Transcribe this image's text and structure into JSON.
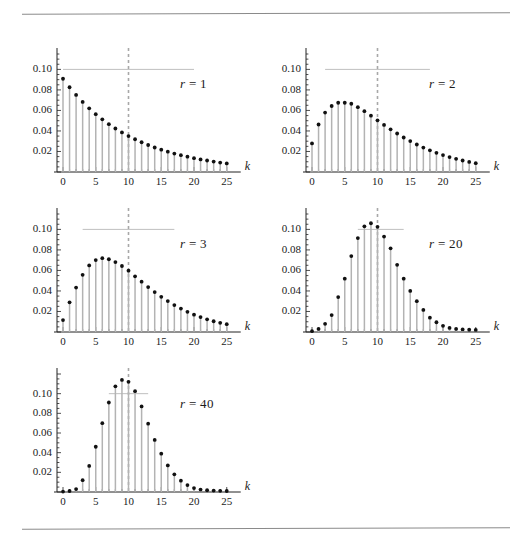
{
  "figure": {
    "title": "",
    "background_color": "#ffffff",
    "rule_color": "#8a8a8a",
    "stem_color": "#b3b3b3",
    "dot_color": "#111111",
    "guide_color": "#b8b8b8",
    "dash_color": "#a8a8a8",
    "axis_color": "#222222",
    "x_axis_label": "k",
    "y_tick_labels": [
      "0.02",
      "0.04",
      "0.06",
      "0.08",
      "0.10"
    ],
    "x_tick_labels": [
      "0",
      "5",
      "10",
      "15",
      "20",
      "25"
    ],
    "panel_labels": [
      "r = 1",
      "r = 2",
      "r = 3",
      "r = 20",
      "r = 40"
    ]
  },
  "chart_data": [
    {
      "type": "bar",
      "title": "r = 1",
      "label_r_symbol": "r",
      "label_equals": "=",
      "label_r_value": "1",
      "xlabel": "k",
      "ylabel": "",
      "xlim": [
        -1,
        26
      ],
      "ylim": [
        0,
        0.115
      ],
      "xticks": [
        0,
        5,
        10,
        15,
        20,
        25
      ],
      "yticks": [
        0.02,
        0.04,
        0.06,
        0.08,
        0.1
      ],
      "grid": false,
      "legend": "none",
      "reference_line_y": 0.1,
      "reference_line_x_span": [
        0,
        20
      ],
      "vertical_dashed_line_x": 10,
      "categories": [
        0,
        1,
        2,
        3,
        4,
        5,
        6,
        7,
        8,
        9,
        10,
        11,
        12,
        13,
        14,
        15,
        16,
        17,
        18,
        19,
        20,
        21,
        22,
        23,
        24,
        25
      ],
      "values": [
        0.0909,
        0.0826,
        0.0751,
        0.0683,
        0.0621,
        0.0564,
        0.0513,
        0.0466,
        0.0424,
        0.0386,
        0.035,
        0.0319,
        0.029,
        0.0263,
        0.0239,
        0.0218,
        0.0198,
        0.018,
        0.0164,
        0.0149,
        0.0135,
        0.0123,
        0.0112,
        0.0102,
        0.0092,
        0.0084
      ]
    },
    {
      "type": "bar",
      "title": "r = 2",
      "label_r_symbol": "r",
      "label_equals": "=",
      "label_r_value": "2",
      "xlabel": "k",
      "ylabel": "",
      "xlim": [
        -1,
        26
      ],
      "ylim": [
        0,
        0.115
      ],
      "xticks": [
        0,
        5,
        10,
        15,
        20,
        25
      ],
      "yticks": [
        0.02,
        0.04,
        0.06,
        0.08,
        0.1
      ],
      "grid": false,
      "legend": "none",
      "reference_line_y": 0.1,
      "reference_line_x_span": [
        2,
        18
      ],
      "vertical_dashed_line_x": 10,
      "categories": [
        0,
        1,
        2,
        3,
        4,
        5,
        6,
        7,
        8,
        9,
        10,
        11,
        12,
        13,
        14,
        15,
        16,
        17,
        18,
        19,
        20,
        21,
        22,
        23,
        24,
        25
      ],
      "values": [
        0.0278,
        0.0463,
        0.0579,
        0.0643,
        0.0675,
        0.0675,
        0.0665,
        0.0632,
        0.0593,
        0.0549,
        0.0504,
        0.0459,
        0.0416,
        0.0375,
        0.0336,
        0.0301,
        0.0268,
        0.0238,
        0.0211,
        0.0187,
        0.0165,
        0.0145,
        0.0128,
        0.0112,
        0.0098,
        0.0086
      ]
    },
    {
      "type": "bar",
      "title": "r = 3",
      "label_r_symbol": "r",
      "label_equals": "=",
      "label_r_value": "3",
      "xlabel": "k",
      "ylabel": "",
      "xlim": [
        -1,
        26
      ],
      "ylim": [
        0,
        0.115
      ],
      "xticks": [
        0,
        5,
        10,
        15,
        20,
        25
      ],
      "yticks": [
        0.02,
        0.04,
        0.06,
        0.08,
        0.1
      ],
      "grid": false,
      "legend": "none",
      "reference_line_y": 0.1,
      "reference_line_x_span": [
        3,
        17
      ],
      "vertical_dashed_line_x": 10,
      "categories": [
        0,
        1,
        2,
        3,
        4,
        5,
        6,
        7,
        8,
        9,
        10,
        11,
        12,
        13,
        14,
        15,
        16,
        17,
        18,
        19,
        20,
        21,
        22,
        23,
        24,
        25
      ],
      "values": [
        0.0116,
        0.0289,
        0.0433,
        0.0557,
        0.0649,
        0.0701,
        0.0719,
        0.0709,
        0.0681,
        0.0643,
        0.0598,
        0.0543,
        0.049,
        0.0438,
        0.0389,
        0.0343,
        0.0301,
        0.0262,
        0.0228,
        0.0197,
        0.0169,
        0.0145,
        0.0124,
        0.0105,
        0.0089,
        0.0076
      ]
    },
    {
      "type": "bar",
      "title": "r = 20",
      "label_r_symbol": "r",
      "label_equals": "=",
      "label_r_value": "20",
      "xlabel": "k",
      "ylabel": "",
      "xlim": [
        -1,
        26
      ],
      "ylim": [
        0,
        0.115
      ],
      "xticks": [
        0,
        5,
        10,
        15,
        20,
        25
      ],
      "yticks": [
        0.02,
        0.04,
        0.06,
        0.08,
        0.1
      ],
      "grid": false,
      "legend": "none",
      "reference_line_y": 0.1,
      "reference_line_x_span": [
        7,
        14
      ],
      "vertical_dashed_line_x": 10,
      "categories": [
        0,
        1,
        2,
        3,
        4,
        5,
        6,
        7,
        8,
        9,
        10,
        11,
        12,
        13,
        14,
        15,
        16,
        17,
        18,
        19,
        20,
        21,
        22,
        23,
        24,
        25
      ],
      "values": [
        0.0008,
        0.003,
        0.008,
        0.0165,
        0.034,
        0.052,
        0.074,
        0.0915,
        0.103,
        0.106,
        0.1025,
        0.093,
        0.0815,
        0.0655,
        0.052,
        0.04,
        0.03,
        0.0215,
        0.014,
        0.0095,
        0.006,
        0.004,
        0.003,
        0.0025,
        0.0022,
        0.002
      ]
    },
    {
      "type": "bar",
      "title": "r = 40",
      "label_r_symbol": "r",
      "label_equals": "=",
      "label_r_value": "40",
      "xlabel": "k",
      "ylabel": "",
      "xlim": [
        -1,
        26
      ],
      "ylim": [
        0,
        0.12
      ],
      "xticks": [
        0,
        5,
        10,
        15,
        20,
        25
      ],
      "yticks": [
        0.02,
        0.04,
        0.06,
        0.08,
        0.1
      ],
      "grid": false,
      "legend": "none",
      "reference_line_y": 0.1,
      "reference_line_x_span": [
        7,
        13
      ],
      "vertical_dashed_line_x": 10,
      "categories": [
        0,
        1,
        2,
        3,
        4,
        5,
        6,
        7,
        8,
        9,
        10,
        11,
        12,
        13,
        14,
        15,
        16,
        17,
        18,
        19,
        20,
        21,
        22,
        23,
        24,
        25
      ],
      "values": [
        0.0004,
        0.001,
        0.003,
        0.012,
        0.0265,
        0.046,
        0.07,
        0.091,
        0.1075,
        0.114,
        0.112,
        0.1025,
        0.087,
        0.0695,
        0.053,
        0.039,
        0.027,
        0.018,
        0.0115,
        0.007,
        0.004,
        0.0025,
        0.0018,
        0.0015,
        0.0012,
        0.001
      ]
    }
  ]
}
